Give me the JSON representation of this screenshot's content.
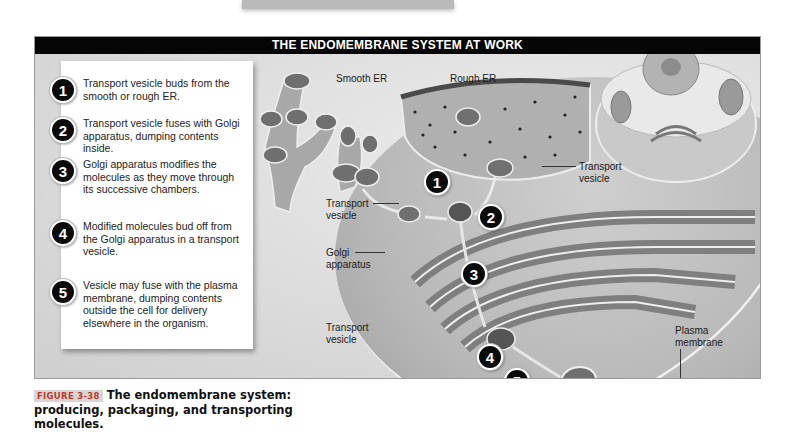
{
  "figure": {
    "header_title": "THE ENDOMEMBRANE SYSTEM AT WORK",
    "steps": [
      {
        "number": "1",
        "text": "Transport vesicle buds from the smooth or rough ER."
      },
      {
        "number": "2",
        "text": "Transport vesicle fuses with Golgi apparatus, dumping contents inside."
      },
      {
        "number": "3",
        "text": "Golgi apparatus modifies the molecules as they move through its successive chambers."
      },
      {
        "number": "4",
        "text": "Modified molecules bud off from the Golgi apparatus in a transport vesicle."
      },
      {
        "number": "5",
        "text": "Vesicle may fuse with the plasma membrane, dumping contents outside the cell for delivery elsewhere in the organism."
      }
    ],
    "labels": {
      "smooth_er": "Smooth ER",
      "rough_er": "Rough ER",
      "transport_vesicle_right": "Transport vesicle",
      "transport_vesicle_left": "Transport vesicle",
      "golgi_apparatus": "Golgi apparatus",
      "transport_vesicle_lower": "Transport vesicle",
      "plasma_membrane": "Plasma membrane"
    },
    "diagram_badges": [
      "1",
      "2",
      "3",
      "4",
      "5"
    ],
    "caption": {
      "tag": "FIGURE 3-38",
      "text": "The endomembrane system: producing, packaging, and transporting molecules."
    }
  }
}
